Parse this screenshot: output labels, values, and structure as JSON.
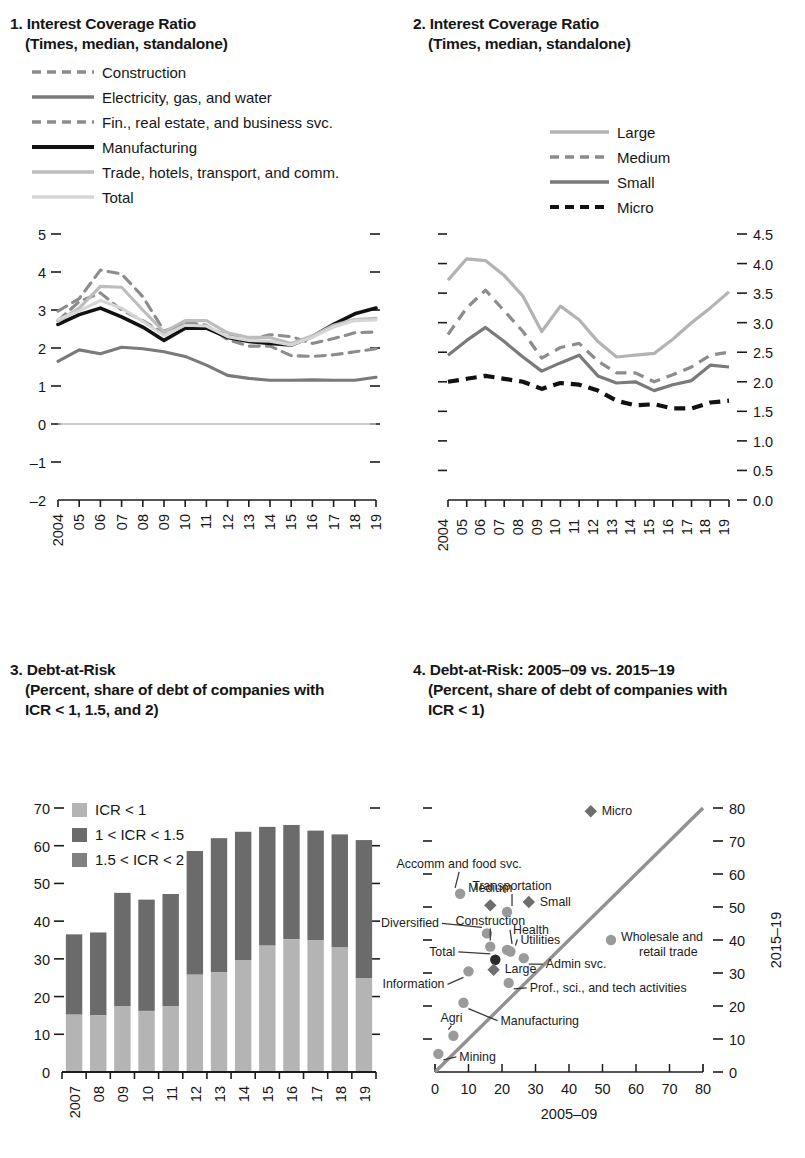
{
  "panels": {
    "p1": {
      "number": "1.",
      "title": "Interest Coverage Ratio",
      "subtitle": "(Times, median, standalone)",
      "legend": [
        {
          "label": "Construction",
          "color": "#8c8c8c",
          "style": "dashed"
        },
        {
          "label": "Electricity, gas, and water",
          "color": "#7a7a7a",
          "style": "solid"
        },
        {
          "label": "Fin., real estate, and business svc.",
          "color": "#8c8c8c",
          "style": "dashed"
        },
        {
          "label": "Manufacturing",
          "color": "#111111",
          "style": "solid"
        },
        {
          "label": "Trade, hotels, transport, and comm.",
          "color": "#bdbdbd",
          "style": "solid"
        },
        {
          "label": "Total",
          "color": "#d6d6d6",
          "style": "solid"
        }
      ],
      "ylabels": [
        "5",
        "4",
        "3",
        "2",
        "1",
        "0",
        "–1",
        "–2"
      ],
      "xlabels": [
        "2004",
        "05",
        "06",
        "07",
        "08",
        "09",
        "10",
        "11",
        "12",
        "13",
        "14",
        "15",
        "16",
        "17",
        "18",
        "19"
      ]
    },
    "p2": {
      "number": "2.",
      "title": "Interest Coverage Ratio",
      "subtitle": "(Times, median, standalone)",
      "legend": [
        {
          "label": "Large",
          "color": "#b3b3b3",
          "style": "solid"
        },
        {
          "label": "Medium",
          "color": "#8c8c8c",
          "style": "dashed"
        },
        {
          "label": "Small",
          "color": "#7a7a7a",
          "style": "solid"
        },
        {
          "label": "Micro",
          "color": "#111111",
          "style": "dashed"
        }
      ],
      "ylabels": [
        "4.5",
        "4.0",
        "3.5",
        "3.0",
        "2.5",
        "2.0",
        "1.5",
        "1.0",
        "0.5",
        "0.0"
      ],
      "xlabels": [
        "2004",
        "05",
        "06",
        "07",
        "08",
        "09",
        "10",
        "11",
        "12",
        "13",
        "14",
        "15",
        "16",
        "17",
        "18",
        "19"
      ]
    },
    "p3": {
      "number": "3.",
      "title": "Debt-at-Risk",
      "subtitle_1": "(Percent, share of debt of companies with",
      "subtitle_2": "ICR < 1, 1.5, and 2)",
      "legend": [
        {
          "label": "ICR < 1",
          "color": "#b4b4b4"
        },
        {
          "label": "1 < ICR < 1.5",
          "color": "#6b6b6b"
        },
        {
          "label": "1.5 < ICR < 2",
          "color": "#808080"
        }
      ],
      "ylabels": [
        "70",
        "60",
        "50",
        "40",
        "30",
        "20",
        "10",
        "0"
      ],
      "xlabels": [
        "2007",
        "08",
        "09",
        "10",
        "11",
        "12",
        "13",
        "14",
        "15",
        "16",
        "17",
        "18",
        "19"
      ]
    },
    "p4": {
      "number": "4.",
      "title": "Debt-at-Risk: 2005–09 vs. 2015–19",
      "subtitle_1": "(Percent, share of debt of companies with",
      "subtitle_2": "ICR < 1)",
      "xaxis_title": "2005–09",
      "yaxis_title": "2015–19",
      "xlabels": [
        "0",
        "10",
        "20",
        "30",
        "40",
        "50",
        "60",
        "70",
        "80"
      ],
      "ylabels": [
        "80",
        "70",
        "60",
        "50",
        "40",
        "30",
        "20",
        "10",
        "0"
      ]
    }
  },
  "chart_data": [
    {
      "type": "line",
      "panel": "1",
      "title": "Interest Coverage Ratio",
      "subtitle": "(Times, median, standalone)",
      "xlabel": "",
      "ylabel": "",
      "ylim": [
        -2,
        5
      ],
      "grid": false,
      "legend_position": "top-left",
      "x": [
        "2004",
        "05",
        "06",
        "07",
        "08",
        "09",
        "10",
        "11",
        "12",
        "13",
        "14",
        "15",
        "16",
        "17",
        "18",
        "19"
      ],
      "series": [
        {
          "name": "Construction",
          "color": "#8c8c8c",
          "style": "dashed",
          "values": [
            2.97,
            3.3,
            4.05,
            3.95,
            3.35,
            2.45,
            2.62,
            2.55,
            2.33,
            2.22,
            2.35,
            2.3,
            2.12,
            2.25,
            2.4,
            2.42
          ]
        },
        {
          "name": "Electricity, gas, and water",
          "color": "#7a7a7a",
          "style": "solid",
          "values": [
            1.65,
            1.95,
            1.85,
            2.02,
            1.98,
            1.9,
            1.78,
            1.55,
            1.28,
            1.2,
            1.15,
            1.15,
            1.16,
            1.15,
            1.15,
            1.23
          ]
        },
        {
          "name": "Fin., real estate, and business svc.",
          "color": "#8c8c8c",
          "style": "dashed",
          "values": [
            2.72,
            3.22,
            3.45,
            3.0,
            2.72,
            2.38,
            2.68,
            2.6,
            2.22,
            2.05,
            2.05,
            1.8,
            1.78,
            1.82,
            1.9,
            1.98
          ]
        },
        {
          "name": "Manufacturing",
          "color": "#111111",
          "style": "solid",
          "values": [
            2.62,
            2.88,
            3.05,
            2.82,
            2.55,
            2.2,
            2.52,
            2.52,
            2.28,
            2.17,
            2.12,
            2.08,
            2.3,
            2.62,
            2.9,
            3.05
          ]
        },
        {
          "name": "Trade, hotels, transport, and comm.",
          "color": "#bdbdbd",
          "style": "solid",
          "values": [
            2.7,
            3.05,
            3.62,
            3.6,
            3.0,
            2.42,
            2.72,
            2.72,
            2.4,
            2.28,
            2.28,
            2.12,
            2.32,
            2.6,
            2.75,
            2.78
          ]
        },
        {
          "name": "Total",
          "color": "#d6d6d6",
          "style": "solid",
          "values": [
            2.75,
            2.98,
            3.25,
            3.05,
            2.7,
            2.33,
            2.6,
            2.58,
            2.3,
            2.2,
            2.18,
            2.08,
            2.28,
            2.55,
            2.72,
            2.74
          ]
        }
      ]
    },
    {
      "type": "line",
      "panel": "2",
      "title": "Interest Coverage Ratio",
      "subtitle": "(Times, median, standalone)",
      "xlabel": "",
      "ylabel": "",
      "ylim": [
        0.0,
        4.5
      ],
      "grid": false,
      "legend_position": "top-center",
      "x": [
        "2004",
        "05",
        "06",
        "07",
        "08",
        "09",
        "10",
        "11",
        "12",
        "13",
        "14",
        "15",
        "16",
        "17",
        "18",
        "19"
      ],
      "series": [
        {
          "name": "Large",
          "color": "#b3b3b3",
          "style": "solid",
          "values": [
            3.72,
            4.08,
            4.05,
            3.8,
            3.45,
            2.85,
            3.28,
            3.05,
            2.68,
            2.42,
            2.45,
            2.48,
            2.72,
            3.0,
            3.25,
            3.52
          ]
        },
        {
          "name": "Medium",
          "color": "#8c8c8c",
          "style": "dashed",
          "values": [
            2.8,
            3.25,
            3.55,
            3.2,
            2.85,
            2.4,
            2.58,
            2.65,
            2.35,
            2.15,
            2.15,
            2.0,
            2.12,
            2.25,
            2.45,
            2.5
          ]
        },
        {
          "name": "Small",
          "color": "#7a7a7a",
          "style": "solid",
          "values": [
            2.45,
            2.7,
            2.92,
            2.68,
            2.42,
            2.18,
            2.32,
            2.45,
            2.1,
            1.98,
            2.0,
            1.85,
            1.95,
            2.02,
            2.28,
            2.25
          ]
        },
        {
          "name": "Micro",
          "color": "#111111",
          "style": "dashed",
          "values": [
            2.0,
            2.05,
            2.1,
            2.05,
            2.0,
            1.88,
            1.98,
            1.95,
            1.85,
            1.68,
            1.6,
            1.62,
            1.55,
            1.55,
            1.65,
            1.68
          ]
        }
      ]
    },
    {
      "type": "bar",
      "panel": "3",
      "title": "Debt-at-Risk",
      "subtitle": "(Percent, share of debt of companies with ICR < 1, 1.5, and 2)",
      "stacked": true,
      "xlabel": "",
      "ylabel": "",
      "ylim": [
        0,
        70
      ],
      "grid": false,
      "legend_position": "top-left",
      "categories": [
        "2007",
        "08",
        "09",
        "10",
        "11",
        "12",
        "13",
        "14",
        "15",
        "16",
        "17",
        "18",
        "19"
      ],
      "series": [
        {
          "name": "ICR < 1",
          "color": "#b4b4b4",
          "values": [
            15.2,
            15.0,
            17.5,
            16.2,
            17.5,
            25.8,
            26.5,
            29.7,
            33.5,
            35.2,
            35.0,
            33.0,
            24.8
          ]
        },
        {
          "name": "1 < ICR < 1.5",
          "color": "#6b6b6b",
          "values": [
            11.0,
            11.5,
            15.0,
            15.0,
            15.0,
            17.0,
            18.0,
            18.0,
            12.0,
            10.0,
            11.0,
            14.0,
            20.0
          ]
        },
        {
          "name": "1.5 < ICR < 2",
          "color": "#808080",
          "values": [
            10.3,
            10.5,
            15.0,
            14.5,
            14.7,
            15.8,
            17.5,
            16.0,
            19.5,
            20.3,
            18.0,
            16.0,
            16.7
          ]
        }
      ],
      "totals": [
        36.5,
        37.0,
        47.5,
        45.7,
        47.2,
        58.6,
        62.0,
        63.7,
        65.0,
        65.5,
        64.0,
        63.0,
        61.5
      ]
    },
    {
      "type": "scatter",
      "panel": "4",
      "title": "Debt-at-Risk: 2005–09 vs. 2015–19",
      "subtitle": "(Percent, share of debt of companies with ICR < 1)",
      "xlabel": "2005–09",
      "ylabel": "2015–19",
      "xlim": [
        0,
        80
      ],
      "ylim": [
        0,
        80
      ],
      "grid": false,
      "diagonal_line": true,
      "points": [
        {
          "label": "Micro",
          "x": 46.5,
          "y": 79.0,
          "marker": "diamond",
          "color": "#6e6e6e",
          "label_dx": 11,
          "label_dy": 4,
          "leader": false
        },
        {
          "label": "Accomm and food svc.",
          "x": 7.5,
          "y": 54.0,
          "marker": "circle",
          "color": "#9a9a9a",
          "label_dx": -1,
          "label_dy": -26,
          "leader": true
        },
        {
          "label": "Medium",
          "x": 16.5,
          "y": 50.5,
          "marker": "diamond",
          "color": "#6e6e6e",
          "label_dx": 0,
          "label_dy": -13,
          "leader": false
        },
        {
          "label": "Transportation",
          "x": 21.5,
          "y": 48.5,
          "marker": "circle",
          "color": "#9a9a9a",
          "label_dx": 5,
          "label_dy": -22,
          "leader": true
        },
        {
          "label": "Small",
          "x": 28.0,
          "y": 51.5,
          "marker": "diamond",
          "color": "#6e6e6e",
          "label_dx": 11,
          "label_dy": 4,
          "leader": false
        },
        {
          "label": "Diversified",
          "x": 15.5,
          "y": 42.0,
          "marker": "circle",
          "color": "#9a9a9a",
          "label_dx": -48,
          "label_dy": -6,
          "leader": true
        },
        {
          "label": "Construction",
          "x": 16.5,
          "y": 38.0,
          "marker": "circle",
          "color": "#9a9a9a",
          "label_dx": 0,
          "label_dy": -22,
          "leader": true
        },
        {
          "label": "Health",
          "x": 21.5,
          "y": 37.0,
          "marker": "circle",
          "color": "#9a9a9a",
          "label_dx": 6,
          "label_dy": -16,
          "leader": true
        },
        {
          "label": "Utilities",
          "x": 22.5,
          "y": 36.5,
          "marker": "circle",
          "color": "#9a9a9a",
          "label_dx": 10,
          "label_dy": -8,
          "leader": true
        },
        {
          "label": "Total",
          "x": 18.0,
          "y": 34.0,
          "marker": "circle",
          "color": "#2a2a2a",
          "label_dx": -40,
          "label_dy": -4,
          "leader": true
        },
        {
          "label": "Large",
          "x": 17.5,
          "y": 31.0,
          "marker": "diamond",
          "color": "#6e6e6e",
          "label_dx": 11,
          "label_dy": 3,
          "leader": false
        },
        {
          "label": "Admin svc.",
          "x": 26.5,
          "y": 34.5,
          "marker": "circle",
          "color": "#9a9a9a",
          "label_dx": 22,
          "label_dy": 10,
          "leader": true
        },
        {
          "label": "Information",
          "x": 10.0,
          "y": 30.5,
          "marker": "circle",
          "color": "#9a9a9a",
          "label_dx": -24,
          "label_dy": 17,
          "leader": true
        },
        {
          "label": "Prof., sci., and tech activities",
          "x": 22.0,
          "y": 27.0,
          "marker": "circle",
          "color": "#9a9a9a",
          "label_dx": 21,
          "label_dy": 9,
          "leader": true
        },
        {
          "label": "Manufacturing",
          "x": 8.5,
          "y": 21.0,
          "marker": "circle",
          "color": "#9a9a9a",
          "label_dx": 37,
          "label_dy": 22,
          "leader": true
        },
        {
          "label": "Agri",
          "x": 5.5,
          "y": 11.0,
          "marker": "circle",
          "color": "#9a9a9a",
          "label_dx": -2,
          "label_dy": -14,
          "leader": true
        },
        {
          "label": "Mining",
          "x": 1.0,
          "y": 5.5,
          "marker": "circle",
          "color": "#9a9a9a",
          "label_dx": 21,
          "label_dy": 7,
          "leader": true
        },
        {
          "label": "Wholesale and retail trade",
          "x": 41.0,
          "y": 40.0,
          "marker": "circle",
          "color": "#9a9a9a",
          "label_dx": 10,
          "label_dy": 4,
          "leader": false,
          "is_legend": true
        }
      ]
    }
  ]
}
